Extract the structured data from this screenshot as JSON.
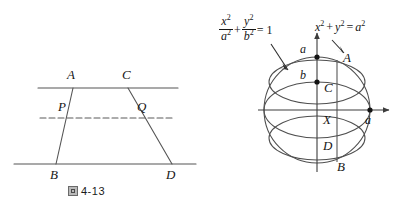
{
  "page": {
    "background": "#ffffff",
    "ink": "#161616",
    "line_color": "#555555"
  },
  "figures": [
    {
      "id": "fig-4-13",
      "caption_glyph": "图",
      "caption_text": "4-13",
      "description": "Trapezoid ABDC between two parallel lines with a dashed midline through P and Q",
      "vertex_labels": [
        {
          "name": "A",
          "text": "A",
          "x": 73,
          "y": 88
        },
        {
          "name": "C",
          "text": "C",
          "x": 128,
          "y": 88
        },
        {
          "name": "P",
          "text": "P",
          "x": 66,
          "y": 118
        },
        {
          "name": "Q",
          "text": "Q",
          "x": 137,
          "y": 118
        },
        {
          "name": "B",
          "text": "B",
          "x": 56,
          "y": 164
        },
        {
          "name": "D",
          "text": "D",
          "x": 172,
          "y": 164
        }
      ],
      "lines": {
        "top_line": {
          "x1": 38,
          "y1": 88,
          "x2": 178,
          "y2": 88,
          "style": "solid"
        },
        "bottom_line": {
          "x1": 14,
          "y1": 164,
          "x2": 196,
          "y2": 164,
          "style": "solid"
        },
        "mid_line": {
          "x1": 40,
          "y1": 118,
          "x2": 172,
          "y2": 118,
          "style": "dashed"
        },
        "left_leg": {
          "x1": 73,
          "y1": 88,
          "x2": 56,
          "y2": 164
        },
        "right_leg": {
          "x1": 128,
          "y1": 88,
          "x2": 172,
          "y2": 164
        }
      }
    },
    {
      "id": "fig-4-14",
      "caption_glyph": "图",
      "caption_text": "4-14",
      "description": "Sphere of radius a with inscribed ellipsoid, coordinate axes, and a vertical chord through A, C, X, D, B",
      "formula_ellipse": {
        "name": "ellipse-equation",
        "num1": "x",
        "num1_sup": "2",
        "den1": "a",
        "den1_sup": "2",
        "plus": "+",
        "num2": "y",
        "num2_sup": "2",
        "den2": "b",
        "den2_sup": "2",
        "equals": "= 1"
      },
      "formula_circle": {
        "name": "circle-equation",
        "x": "x",
        "x_sup": "2",
        "plus": "+",
        "y": "y",
        "y_sup": "2",
        "equals": "=",
        "a": "a",
        "a_sup": "2"
      },
      "point_labels": [
        {
          "name": "a-top",
          "text": "a",
          "x": 303,
          "y": 55
        },
        {
          "name": "b-label",
          "text": "b",
          "x": 304,
          "y": 80
        },
        {
          "name": "A-label",
          "text": "A",
          "x": 343,
          "y": 60
        },
        {
          "name": "C-label",
          "text": "C",
          "x": 327,
          "y": 90
        },
        {
          "name": "X-label",
          "text": "X",
          "x": 325,
          "y": 122
        },
        {
          "name": "D-label",
          "text": "D",
          "x": 326,
          "y": 148
        },
        {
          "name": "B-label",
          "text": "B",
          "x": 339,
          "y": 168
        },
        {
          "name": "a-right",
          "text": "a",
          "x": 365,
          "y": 122
        }
      ],
      "geometry": {
        "center_x": 317,
        "center_y": 110,
        "circle_radius": 53,
        "inner_ellipse_ry": 28,
        "chord_x": 337,
        "x_axis": {
          "x1": 258,
          "y1": 110,
          "x2": 392,
          "y2": 110
        },
        "y_axis": {
          "x1": 317,
          "y1": 172,
          "x2": 317,
          "y2": 30
        }
      }
    }
  ]
}
